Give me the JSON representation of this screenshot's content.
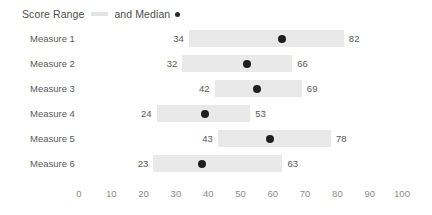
{
  "legend": {
    "range_label": "Score Range",
    "median_label": "and Median",
    "range_swatch_color": "#e4e4e4",
    "median_swatch_color": "#2b2b2b"
  },
  "chart_data": {
    "type": "bar",
    "title": "Score Range and Median",
    "subtitle": "",
    "xlabel": "",
    "ylabel": "",
    "orientation": "horizontal",
    "grid": false,
    "legend_position": "top-left",
    "xlim": [
      0,
      100
    ],
    "xticks": [
      0,
      10,
      20,
      30,
      40,
      50,
      60,
      70,
      80,
      90,
      100
    ],
    "xtick_labels": [
      "0",
      "10",
      "20",
      "30",
      "40",
      "50",
      "60",
      "70",
      "80",
      "90",
      "100"
    ],
    "categories": [
      "Measure 1",
      "Measure 2",
      "Measure 3",
      "Measure 4",
      "Measure 5",
      "Measure 6"
    ],
    "series": [
      {
        "name": "Score Range",
        "type": "range",
        "color": "#e9e9e9",
        "low": [
          34,
          32,
          42,
          24,
          43,
          23
        ],
        "high": [
          82,
          66,
          69,
          53,
          78,
          63
        ]
      },
      {
        "name": "Median",
        "type": "marker",
        "color": "#1f1f1f",
        "values": [
          63,
          52,
          55,
          39,
          59,
          38
        ]
      }
    ],
    "rows": [
      {
        "label": "Measure 1",
        "min": 34,
        "max": 82,
        "median": 63,
        "min_text": "34",
        "max_text": "82"
      },
      {
        "label": "Measure 2",
        "min": 32,
        "max": 66,
        "median": 52,
        "min_text": "32",
        "max_text": "66"
      },
      {
        "label": "Measure 3",
        "min": 42,
        "max": 69,
        "median": 55,
        "min_text": "42",
        "max_text": "69"
      },
      {
        "label": "Measure 4",
        "min": 24,
        "max": 53,
        "median": 39,
        "min_text": "24",
        "max_text": "53"
      },
      {
        "label": "Measure 5",
        "min": 43,
        "max": 78,
        "median": 59,
        "min_text": "43",
        "max_text": "78"
      },
      {
        "label": "Measure 6",
        "min": 23,
        "max": 63,
        "median": 38,
        "min_text": "23",
        "max_text": "63"
      }
    ]
  },
  "layout": {
    "axis_x0_px": 79,
    "axis_x100_px": 402,
    "row_height_px": 25
  }
}
